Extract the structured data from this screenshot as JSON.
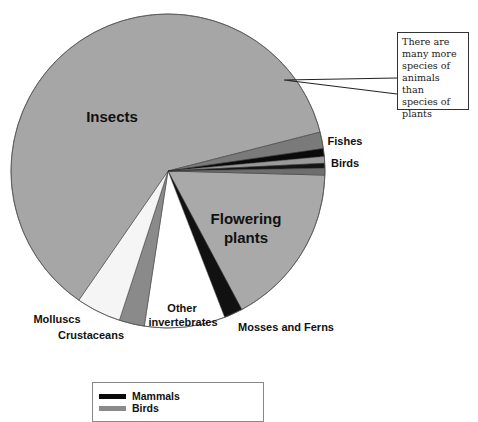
{
  "chart_data": {
    "type": "pie",
    "title": "",
    "start_angle_deg": 1.5,
    "direction": "clockwise",
    "slices": [
      {
        "label": "Flowering plants",
        "percent": 16.8,
        "color": "#a9a9a9"
      },
      {
        "label": "Mosses and Ferns",
        "percent": 1.9,
        "color": "#111111"
      },
      {
        "label": "Other invertebrates",
        "percent": 8.3,
        "color": "#ffffff"
      },
      {
        "label": "Crustaceans",
        "percent": 2.6,
        "color": "#8a8a8a"
      },
      {
        "label": "Molluscs",
        "percent": 4.6,
        "color": "#f5f5f5"
      },
      {
        "label": "Insects",
        "percent": 61.4,
        "color": "#a6a6a6"
      },
      {
        "label": "Fishes",
        "percent": 1.7,
        "color": "#7a7a7a"
      },
      {
        "label": "Mammals",
        "percent": 0.8,
        "color": "#0a0a0a"
      },
      {
        "label": "Birds",
        "percent": 0.7,
        "color": "#9a9a9a"
      },
      {
        "label": "",
        "percent": 0.5,
        "color": "#151515"
      },
      {
        "label": "",
        "percent": 0.7,
        "color": "#6e6e6e"
      }
    ],
    "labels": [
      {
        "text": "Insects",
        "x": 112,
        "y": 122,
        "size": 15
      },
      {
        "text": "Flowering",
        "x": 246,
        "y": 224,
        "size": 15
      },
      {
        "text": "plants",
        "x": 246,
        "y": 243,
        "size": 15
      },
      {
        "text": "Fishes",
        "x": 345,
        "y": 145,
        "size": 11
      },
      {
        "text": "Birds",
        "x": 345,
        "y": 167,
        "size": 11
      },
      {
        "text": "Other",
        "x": 182,
        "y": 312,
        "size": 11
      },
      {
        "text": "invertebrates",
        "x": 183,
        "y": 326,
        "size": 11
      },
      {
        "text": "Mosses and Ferns",
        "x": 286,
        "y": 331,
        "size": 11
      },
      {
        "text": "Molluscs",
        "x": 57,
        "y": 323,
        "size": 11
      },
      {
        "text": "Crustaceans",
        "x": 91,
        "y": 339,
        "size": 11
      }
    ],
    "legend": {
      "position": "bottom",
      "entries": [
        {
          "label": "Mammals",
          "color": "#0a0a0a"
        },
        {
          "label": "Birds",
          "color": "#8a8a8a"
        }
      ]
    },
    "annotation": "There are many more species of animals than species of plants"
  },
  "callout": {
    "lines": [
      "There are",
      "many more",
      "species of",
      "animals than",
      "species of",
      "plants"
    ]
  },
  "legend": {
    "items": [
      {
        "label": "Mammals",
        "color": "#0a0a0a"
      },
      {
        "label": "Birds",
        "color": "#8a8a8a"
      }
    ]
  }
}
